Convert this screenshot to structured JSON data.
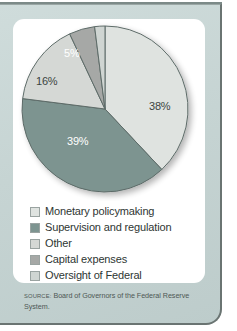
{
  "chart_data": {
    "type": "pie",
    "title": "",
    "subtitle": "",
    "legend_position": "bottom",
    "grid": false,
    "categories": [
      "Monetary policymaking",
      "Supervision and regulation",
      "Other",
      "Capital expenses",
      "Oversight of Federal Reserve banks"
    ],
    "values": [
      38,
      39,
      16,
      5,
      2
    ],
    "value_labels": [
      "38%",
      "39%",
      "16%",
      "5%",
      "2%"
    ],
    "colors": [
      "#dfe3e0",
      "#7d9490",
      "#d5d8d5",
      "#a6a8a6",
      "#cfd5d2"
    ],
    "label_colors": [
      "dark",
      "light",
      "dark",
      "light",
      "dark"
    ],
    "start_angle_deg": 0,
    "direction": "clockwise"
  },
  "slice_labels": {
    "monetary": "38%",
    "supervision": "39%",
    "other": "16%",
    "capital": "5%",
    "oversight": "2%"
  },
  "legend": {
    "items": [
      {
        "label": "Monetary policymaking",
        "color": "#dfe3e0"
      },
      {
        "label": "Supervision and regulation",
        "color": "#7d9490"
      },
      {
        "label": "Other",
        "color": "#d5d8d5"
      },
      {
        "label": "Capital expenses",
        "color": "#a6a8a6"
      },
      {
        "label": "Oversight of Federal",
        "label2": "Reserve banks",
        "color": "#cfd5d2"
      }
    ]
  },
  "source": {
    "label": "SOURCE:",
    "text": " Board of Governors of the Federal Reserve System."
  },
  "theme": {
    "panel_bg": "#c6d4d3",
    "card_bg": "#ffffff",
    "border": "#6a7472",
    "text": "#2e3633"
  }
}
